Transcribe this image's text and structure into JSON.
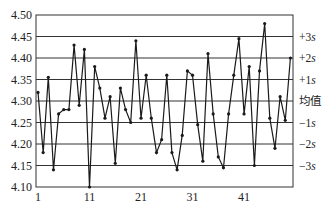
{
  "chart_data": {
    "type": "line",
    "title": "",
    "xlabel": "",
    "ylabel": "",
    "x": [
      1,
      2,
      3,
      4,
      5,
      6,
      7,
      8,
      9,
      10,
      11,
      12,
      13,
      14,
      15,
      16,
      17,
      18,
      19,
      20,
      21,
      22,
      23,
      24,
      25,
      26,
      27,
      28,
      29,
      30,
      31,
      32,
      33,
      34,
      35,
      36,
      37,
      38,
      39,
      40,
      41,
      42,
      43,
      44,
      45,
      46,
      47,
      48,
      49,
      50
    ],
    "series": [
      {
        "name": "measurement",
        "values": [
          4.32,
          4.18,
          4.355,
          4.14,
          4.27,
          4.28,
          4.28,
          4.43,
          4.29,
          4.42,
          4.1,
          4.38,
          4.33,
          4.26,
          4.31,
          4.155,
          4.33,
          4.28,
          4.25,
          4.44,
          4.26,
          4.36,
          4.26,
          4.18,
          4.21,
          4.36,
          4.18,
          4.14,
          4.22,
          4.37,
          4.36,
          4.245,
          4.16,
          4.41,
          4.27,
          4.17,
          4.145,
          4.27,
          4.36,
          4.445,
          4.27,
          4.38,
          4.15,
          4.37,
          4.48,
          4.26,
          4.19,
          4.31,
          4.255,
          4.4
        ]
      }
    ],
    "xticks": [
      1,
      11,
      21,
      31,
      41
    ],
    "xtick_labels": [
      "1",
      "11",
      "21",
      "31",
      "41"
    ],
    "xlim": [
      1,
      50.5
    ],
    "yticks": [
      4.1,
      4.15,
      4.2,
      4.25,
      4.3,
      4.35,
      4.4,
      4.45,
      4.5
    ],
    "ytick_labels": [
      "4.10",
      "4.15",
      "4.20",
      "4.25",
      "4.30",
      "4.35",
      "4.40",
      "4.45",
      "4.50"
    ],
    "ylim": [
      4.1,
      4.5
    ],
    "grid": "horizontal",
    "control_lines": [
      {
        "label": "+3s",
        "value": 4.45
      },
      {
        "label": "+2s",
        "value": 4.4
      },
      {
        "label": "+1s",
        "value": 4.35
      },
      {
        "label": "均值",
        "value": 4.3
      },
      {
        "label": "−1s",
        "value": 4.25
      },
      {
        "label": "−2s",
        "value": 4.2
      },
      {
        "label": "−3s",
        "value": 4.15
      }
    ],
    "legend": "none",
    "colors": {
      "line": "#1a1a1a",
      "grid": "#333333",
      "frame": "#333333",
      "text": "#222222"
    }
  }
}
